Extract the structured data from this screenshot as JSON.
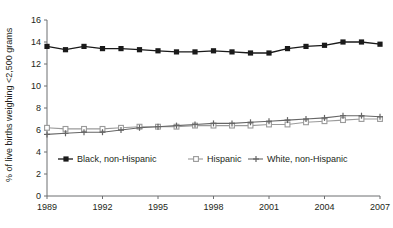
{
  "chart_data": {
    "type": "line",
    "title": "",
    "xlabel": "",
    "ylabel": "% of live births weighing <2,500 grams",
    "xlim": [
      1989,
      2007
    ],
    "ylim": [
      0,
      16
    ],
    "yticks": [
      0,
      2,
      4,
      6,
      8,
      10,
      12,
      14,
      16
    ],
    "ytick_labels": [
      "0",
      "2",
      "4",
      "6",
      "8",
      "10",
      "12",
      "14",
      "16"
    ],
    "xticks": [
      1989,
      1992,
      1995,
      1998,
      2001,
      2004,
      2007
    ],
    "xtick_labels": [
      "1989",
      "1992",
      "1995",
      "1998",
      "2001",
      "2004",
      "2007"
    ],
    "x": [
      1989,
      1990,
      1991,
      1992,
      1993,
      1994,
      1995,
      1996,
      1997,
      1998,
      1999,
      2000,
      2001,
      2002,
      2003,
      2004,
      2005,
      2006,
      2007
    ],
    "grid": false,
    "legend_position": "inside-bottom-left",
    "series": [
      {
        "name": "Black, non-Hispanic",
        "color": "#1a1a1a",
        "marker": "filled-square",
        "values": [
          13.6,
          13.3,
          13.6,
          13.4,
          13.4,
          13.3,
          13.2,
          13.1,
          13.1,
          13.2,
          13.1,
          13.0,
          13.0,
          13.4,
          13.6,
          13.7,
          14.0,
          14.0,
          13.8
        ]
      },
      {
        "name": "Hispanic",
        "color": "#9a9a9a",
        "marker": "open-square",
        "values": [
          6.2,
          6.1,
          6.1,
          6.1,
          6.2,
          6.3,
          6.3,
          6.3,
          6.4,
          6.4,
          6.4,
          6.4,
          6.5,
          6.5,
          6.7,
          6.8,
          6.9,
          7.0,
          7.0
        ]
      },
      {
        "name": "White, non-Hispanic",
        "color": "#666666",
        "marker": "plus-square",
        "values": [
          5.6,
          5.7,
          5.8,
          5.8,
          6.0,
          6.2,
          6.3,
          6.4,
          6.5,
          6.6,
          6.6,
          6.7,
          6.8,
          6.9,
          7.0,
          7.1,
          7.3,
          7.3,
          7.2
        ]
      }
    ]
  },
  "axes": {
    "y_axis_title": "% of live births weighing <2,500 grams"
  },
  "legend": {
    "items": [
      {
        "label": "Black, non-Hispanic"
      },
      {
        "label": "Hispanic"
      },
      {
        "label": "White, non-Hispanic"
      }
    ]
  }
}
